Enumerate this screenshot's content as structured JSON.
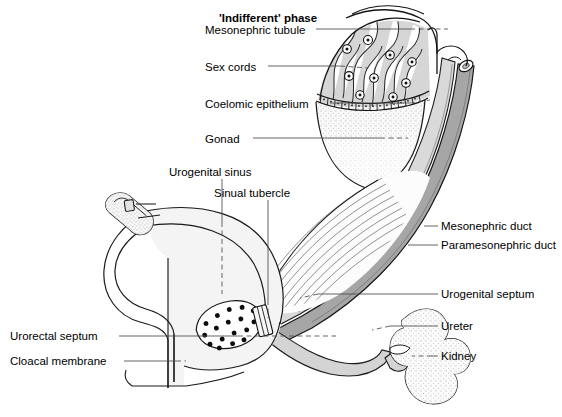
{
  "figure": {
    "title": "'Indifferent' phase",
    "background_color": "#ffffff",
    "ink_color": "#000000"
  },
  "colors": {
    "ink": "#000000",
    "leader_line": "#555555",
    "mesonephric_duct": "#9a9a9a",
    "paramesonephric_duct": "#c9c9c9",
    "sex_cord_field": "#d0d0d0",
    "gonad_stipple": "#e9e9e9",
    "kidney_stipple": "#ededed",
    "sinus_fill": "#f2f2f2",
    "urogenital_septum": "#f4f4f4"
  },
  "labels": [
    {
      "id": "mesonephric-tubule",
      "text": "Mesonephric tubule",
      "side": "left",
      "x": 205,
      "y": 25
    },
    {
      "id": "sex-cords",
      "text": "Sex cords",
      "side": "left",
      "x": 205,
      "y": 62
    },
    {
      "id": "coelomic-epithelium",
      "text": "Coelomic epithelium",
      "side": "left",
      "x": 205,
      "y": 99
    },
    {
      "id": "gonad",
      "text": "Gonad",
      "side": "left",
      "x": 205,
      "y": 134
    },
    {
      "id": "urogenital-sinus",
      "text": "Urogenital sinus",
      "side": "top",
      "x": 169,
      "y": 167
    },
    {
      "id": "sinual-tubercle",
      "text": "Sinual tubercle",
      "side": "top",
      "x": 214,
      "y": 188
    },
    {
      "id": "urorectal-septum",
      "text": "Urorectal septum",
      "side": "left",
      "x": 10,
      "y": 332
    },
    {
      "id": "cloacal-membrane",
      "text": "Cloacal membrane",
      "side": "left",
      "x": 10,
      "y": 358
    },
    {
      "id": "mesonephric-duct",
      "text": "Mesonephric duct",
      "side": "right",
      "x": 441,
      "y": 222
    },
    {
      "id": "paramesonephric-duct",
      "text": "Paramesonephric duct",
      "side": "right",
      "x": 441,
      "y": 241
    },
    {
      "id": "urogenital-septum",
      "text": "Urogenital septum",
      "side": "right",
      "x": 441,
      "y": 290
    },
    {
      "id": "ureter",
      "text": "Ureter",
      "side": "right",
      "x": 441,
      "y": 322
    },
    {
      "id": "kidney",
      "text": "Kidney",
      "side": "right",
      "x": 441,
      "y": 352
    }
  ],
  "structures": [
    {
      "id": "gonad-ridge",
      "name": "Gonad (genital ridge)",
      "texture": "stipple"
    },
    {
      "id": "sex-cord-field",
      "name": "Sex cords with germ cell nuclei",
      "texture": "wavy-cords"
    },
    {
      "id": "coelomic-epithelium-row",
      "name": "Coelomic epithelium cuboidal cell row",
      "texture": "cell-boxes"
    },
    {
      "id": "mesonephric-duct-band",
      "name": "Mesonephric (Wolffian) duct",
      "texture": "solid-dark-band"
    },
    {
      "id": "paramesonephric-duct-band",
      "name": "Paramesonephric (Mullerian) duct",
      "texture": "solid-light-band"
    },
    {
      "id": "urogenital-septum-field",
      "name": "Urogenital septum",
      "texture": "hatched"
    },
    {
      "id": "ureter-tube",
      "name": "Ureter",
      "texture": "solid-light-band"
    },
    {
      "id": "kidney-mass",
      "name": "Kidney (metanephros)",
      "texture": "stipple"
    },
    {
      "id": "urogenital-sinus-body",
      "name": "Urogenital sinus",
      "texture": "pale-fill"
    },
    {
      "id": "sinual-tubercle-patch",
      "name": "Sinual tubercle",
      "texture": "large-dots"
    },
    {
      "id": "hindgut-rectum",
      "name": "Hindgut / rectum",
      "texture": "outline"
    },
    {
      "id": "genital-tubercle",
      "name": "Genital tubercle / phallus",
      "texture": "stipple"
    },
    {
      "id": "cloacal-membrane-line",
      "name": "Cloacal membrane",
      "texture": "outline"
    }
  ]
}
